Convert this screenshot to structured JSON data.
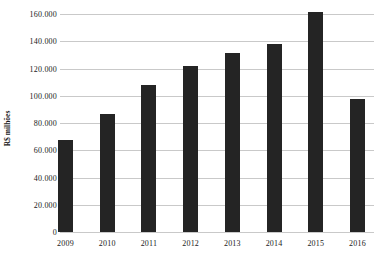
{
  "chart_data": {
    "type": "bar",
    "title": "",
    "xlabel": "",
    "ylabel": "R$ milhões",
    "categories": [
      "2009",
      "2010",
      "2011",
      "2012",
      "2013",
      "2014",
      "2015",
      "2016"
    ],
    "values": [
      68000,
      87000,
      108000,
      122000,
      132000,
      138000,
      162000,
      98000
    ],
    "y_ticks": [
      0,
      20000,
      40000,
      60000,
      80000,
      100000,
      120000,
      140000,
      160000
    ],
    "y_tick_labels": [
      "0",
      "20.000",
      "40.000",
      "60.000",
      "80.000",
      "100.000",
      "120.000",
      "140.000",
      "160.000"
    ],
    "ylim": [
      0,
      160000
    ],
    "grid": true,
    "legend": false,
    "bar_color": "#242424",
    "grid_color": "#c9c9c9",
    "text_color": "#1a1a1a",
    "background_color": "#ffffff"
  }
}
